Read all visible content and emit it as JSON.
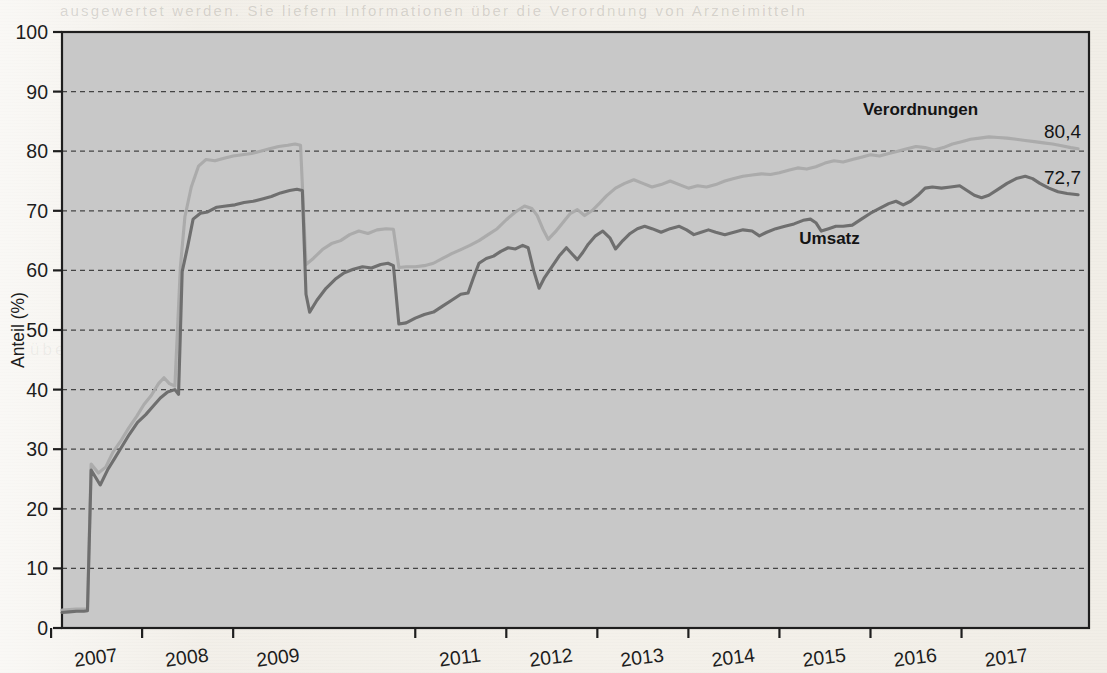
{
  "chart_data": {
    "type": "line",
    "title": "",
    "xlabel": "",
    "ylabel": "Anteil (%)",
    "ylim": [
      0,
      100
    ],
    "ytick_step": 10,
    "ytick_labels": [
      "0",
      "10",
      "20",
      "30",
      "40",
      "50",
      "60",
      "70",
      "80",
      "90",
      "100"
    ],
    "xtick_labels": [
      "2007",
      "2008",
      "2009",
      "2011",
      "2012",
      "2013",
      "2014",
      "2015",
      "2016",
      "2017"
    ],
    "grid": "horizontal-dashed",
    "legend_position": "inline-annotations",
    "plot_background": "#c8c8c8",
    "page_background": "#f3f0ea",
    "series": [
      {
        "name": "Verordnungen",
        "color": "#a9a9a9",
        "end_label": "80,4",
        "label_x": 2016.05,
        "label_y": 86.0,
        "points": [
          [
            2006.62,
            3.0
          ],
          [
            2006.7,
            3.1
          ],
          [
            2006.78,
            3.2
          ],
          [
            2006.86,
            3.2
          ],
          [
            2006.9,
            3.3
          ],
          [
            2006.94,
            27.5
          ],
          [
            2007.02,
            26.0
          ],
          [
            2007.1,
            27.0
          ],
          [
            2007.18,
            29.5
          ],
          [
            2007.27,
            31.5
          ],
          [
            2007.35,
            33.5
          ],
          [
            2007.44,
            35.5
          ],
          [
            2007.52,
            37.5
          ],
          [
            2007.6,
            39.0
          ],
          [
            2007.68,
            41.0
          ],
          [
            2007.74,
            42.0
          ],
          [
            2007.8,
            41.0
          ],
          [
            2007.86,
            40.6
          ],
          [
            2007.92,
            60.5
          ],
          [
            2007.97,
            69.0
          ],
          [
            2008.04,
            74.0
          ],
          [
            2008.12,
            77.5
          ],
          [
            2008.2,
            78.6
          ],
          [
            2008.3,
            78.4
          ],
          [
            2008.4,
            78.8
          ],
          [
            2008.5,
            79.2
          ],
          [
            2008.6,
            79.4
          ],
          [
            2008.7,
            79.6
          ],
          [
            2008.8,
            80.0
          ],
          [
            2008.9,
            80.4
          ],
          [
            2009.0,
            80.8
          ],
          [
            2009.1,
            81.0
          ],
          [
            2009.18,
            81.2
          ],
          [
            2009.24,
            81.0
          ],
          [
            2009.3,
            61.0
          ],
          [
            2009.38,
            62.0
          ],
          [
            2009.48,
            63.5
          ],
          [
            2009.58,
            64.5
          ],
          [
            2009.68,
            65.0
          ],
          [
            2009.78,
            66.0
          ],
          [
            2009.88,
            66.6
          ],
          [
            2009.98,
            66.2
          ],
          [
            2010.08,
            66.8
          ],
          [
            2010.18,
            67.0
          ],
          [
            2010.26,
            66.9
          ],
          [
            2010.32,
            60.5
          ],
          [
            2010.4,
            60.6
          ],
          [
            2010.5,
            60.6
          ],
          [
            2010.6,
            60.8
          ],
          [
            2010.7,
            61.2
          ],
          [
            2010.8,
            62.0
          ],
          [
            2010.9,
            62.8
          ],
          [
            2011.0,
            63.5
          ],
          [
            2011.1,
            64.2
          ],
          [
            2011.2,
            65.0
          ],
          [
            2011.3,
            66.0
          ],
          [
            2011.4,
            67.0
          ],
          [
            2011.5,
            68.5
          ],
          [
            2011.6,
            69.8
          ],
          [
            2011.7,
            70.8
          ],
          [
            2011.78,
            70.4
          ],
          [
            2011.84,
            69.2
          ],
          [
            2011.9,
            67.0
          ],
          [
            2011.96,
            65.2
          ],
          [
            2012.04,
            66.5
          ],
          [
            2012.12,
            68.0
          ],
          [
            2012.2,
            69.5
          ],
          [
            2012.28,
            70.2
          ],
          [
            2012.36,
            69.2
          ],
          [
            2012.44,
            70.0
          ],
          [
            2012.52,
            71.2
          ],
          [
            2012.6,
            72.5
          ],
          [
            2012.7,
            73.8
          ],
          [
            2012.8,
            74.6
          ],
          [
            2012.9,
            75.2
          ],
          [
            2013.0,
            74.6
          ],
          [
            2013.1,
            74.0
          ],
          [
            2013.2,
            74.4
          ],
          [
            2013.3,
            75.0
          ],
          [
            2013.4,
            74.4
          ],
          [
            2013.5,
            73.8
          ],
          [
            2013.6,
            74.2
          ],
          [
            2013.7,
            74.0
          ],
          [
            2013.8,
            74.4
          ],
          [
            2013.9,
            75.0
          ],
          [
            2014.0,
            75.4
          ],
          [
            2014.1,
            75.8
          ],
          [
            2014.2,
            76.0
          ],
          [
            2014.3,
            76.2
          ],
          [
            2014.4,
            76.1
          ],
          [
            2014.5,
            76.4
          ],
          [
            2014.6,
            76.8
          ],
          [
            2014.7,
            77.2
          ],
          [
            2014.8,
            77.0
          ],
          [
            2014.9,
            77.4
          ],
          [
            2015.0,
            78.0
          ],
          [
            2015.1,
            78.4
          ],
          [
            2015.2,
            78.2
          ],
          [
            2015.3,
            78.6
          ],
          [
            2015.4,
            79.0
          ],
          [
            2015.5,
            79.4
          ],
          [
            2015.6,
            79.2
          ],
          [
            2015.7,
            79.6
          ],
          [
            2015.8,
            80.0
          ],
          [
            2015.9,
            80.4
          ],
          [
            2016.0,
            80.8
          ],
          [
            2016.1,
            80.6
          ],
          [
            2016.2,
            80.2
          ],
          [
            2016.3,
            80.6
          ],
          [
            2016.4,
            81.2
          ],
          [
            2016.5,
            81.6
          ],
          [
            2016.6,
            82.0
          ],
          [
            2016.7,
            82.2
          ],
          [
            2016.8,
            82.4
          ],
          [
            2016.9,
            82.3
          ],
          [
            2017.0,
            82.2
          ],
          [
            2017.1,
            82.0
          ],
          [
            2017.2,
            81.8
          ],
          [
            2017.3,
            81.6
          ],
          [
            2017.4,
            81.4
          ],
          [
            2017.5,
            81.2
          ],
          [
            2017.6,
            80.9
          ],
          [
            2017.7,
            80.6
          ],
          [
            2017.78,
            80.4
          ]
        ]
      },
      {
        "name": "Umsatz",
        "color": "#6b6b6b",
        "end_label": "72,7",
        "label_x": 2015.05,
        "label_y": 64.5,
        "points": [
          [
            2006.62,
            2.6
          ],
          [
            2006.7,
            2.7
          ],
          [
            2006.78,
            2.8
          ],
          [
            2006.86,
            2.8
          ],
          [
            2006.9,
            2.9
          ],
          [
            2006.94,
            26.5
          ],
          [
            2007.0,
            25.0
          ],
          [
            2007.04,
            24.0
          ],
          [
            2007.12,
            26.5
          ],
          [
            2007.2,
            28.5
          ],
          [
            2007.28,
            30.5
          ],
          [
            2007.36,
            32.5
          ],
          [
            2007.45,
            34.5
          ],
          [
            2007.54,
            35.8
          ],
          [
            2007.62,
            37.2
          ],
          [
            2007.7,
            38.6
          ],
          [
            2007.78,
            39.6
          ],
          [
            2007.86,
            40.0
          ],
          [
            2007.9,
            39.2
          ],
          [
            2007.94,
            59.8
          ],
          [
            2008.0,
            64.0
          ],
          [
            2008.06,
            68.6
          ],
          [
            2008.14,
            69.6
          ],
          [
            2008.22,
            69.8
          ],
          [
            2008.32,
            70.6
          ],
          [
            2008.42,
            70.8
          ],
          [
            2008.52,
            71.0
          ],
          [
            2008.62,
            71.4
          ],
          [
            2008.72,
            71.6
          ],
          [
            2008.82,
            72.0
          ],
          [
            2008.92,
            72.4
          ],
          [
            2009.02,
            73.0
          ],
          [
            2009.12,
            73.4
          ],
          [
            2009.2,
            73.6
          ],
          [
            2009.26,
            73.4
          ],
          [
            2009.3,
            56.0
          ],
          [
            2009.34,
            53.0
          ],
          [
            2009.42,
            55.0
          ],
          [
            2009.52,
            57.0
          ],
          [
            2009.62,
            58.5
          ],
          [
            2009.72,
            59.6
          ],
          [
            2009.82,
            60.2
          ],
          [
            2009.92,
            60.6
          ],
          [
            2010.02,
            60.4
          ],
          [
            2010.12,
            61.0
          ],
          [
            2010.2,
            61.2
          ],
          [
            2010.26,
            60.8
          ],
          [
            2010.32,
            51.0
          ],
          [
            2010.4,
            51.2
          ],
          [
            2010.5,
            52.0
          ],
          [
            2010.6,
            52.6
          ],
          [
            2010.7,
            53.0
          ],
          [
            2010.8,
            54.0
          ],
          [
            2010.9,
            55.0
          ],
          [
            2011.0,
            56.0
          ],
          [
            2011.08,
            56.2
          ],
          [
            2011.14,
            58.8
          ],
          [
            2011.2,
            61.2
          ],
          [
            2011.28,
            62.0
          ],
          [
            2011.36,
            62.4
          ],
          [
            2011.44,
            63.2
          ],
          [
            2011.52,
            63.8
          ],
          [
            2011.6,
            63.6
          ],
          [
            2011.68,
            64.2
          ],
          [
            2011.74,
            63.8
          ],
          [
            2011.8,
            60.0
          ],
          [
            2011.86,
            57.0
          ],
          [
            2011.92,
            58.8
          ],
          [
            2012.0,
            60.6
          ],
          [
            2012.08,
            62.4
          ],
          [
            2012.16,
            63.8
          ],
          [
            2012.22,
            62.8
          ],
          [
            2012.28,
            61.8
          ],
          [
            2012.34,
            63.0
          ],
          [
            2012.4,
            64.4
          ],
          [
            2012.48,
            65.8
          ],
          [
            2012.56,
            66.6
          ],
          [
            2012.64,
            65.4
          ],
          [
            2012.7,
            63.6
          ],
          [
            2012.78,
            65.0
          ],
          [
            2012.86,
            66.2
          ],
          [
            2012.94,
            67.0
          ],
          [
            2013.02,
            67.4
          ],
          [
            2013.1,
            67.0
          ],
          [
            2013.2,
            66.4
          ],
          [
            2013.3,
            67.0
          ],
          [
            2013.4,
            67.4
          ],
          [
            2013.48,
            66.8
          ],
          [
            2013.56,
            66.0
          ],
          [
            2013.64,
            66.4
          ],
          [
            2013.72,
            66.8
          ],
          [
            2013.8,
            66.4
          ],
          [
            2013.9,
            66.0
          ],
          [
            2014.0,
            66.4
          ],
          [
            2014.1,
            66.8
          ],
          [
            2014.2,
            66.6
          ],
          [
            2014.28,
            65.8
          ],
          [
            2014.36,
            66.4
          ],
          [
            2014.46,
            67.0
          ],
          [
            2014.56,
            67.4
          ],
          [
            2014.66,
            67.8
          ],
          [
            2014.76,
            68.4
          ],
          [
            2014.84,
            68.6
          ],
          [
            2014.9,
            68.0
          ],
          [
            2014.96,
            66.6
          ],
          [
            2015.04,
            67.0
          ],
          [
            2015.12,
            67.4
          ],
          [
            2015.2,
            67.4
          ],
          [
            2015.3,
            67.6
          ],
          [
            2015.4,
            68.6
          ],
          [
            2015.5,
            69.6
          ],
          [
            2015.6,
            70.4
          ],
          [
            2015.7,
            71.2
          ],
          [
            2015.78,
            71.6
          ],
          [
            2015.86,
            71.0
          ],
          [
            2015.94,
            71.6
          ],
          [
            2016.02,
            72.6
          ],
          [
            2016.1,
            73.8
          ],
          [
            2016.18,
            74.0
          ],
          [
            2016.28,
            73.8
          ],
          [
            2016.38,
            74.0
          ],
          [
            2016.48,
            74.2
          ],
          [
            2016.56,
            73.4
          ],
          [
            2016.64,
            72.6
          ],
          [
            2016.72,
            72.2
          ],
          [
            2016.8,
            72.6
          ],
          [
            2016.9,
            73.6
          ],
          [
            2017.0,
            74.6
          ],
          [
            2017.1,
            75.4
          ],
          [
            2017.2,
            75.8
          ],
          [
            2017.28,
            75.4
          ],
          [
            2017.36,
            74.6
          ],
          [
            2017.46,
            73.8
          ],
          [
            2017.56,
            73.2
          ],
          [
            2017.66,
            72.9
          ],
          [
            2017.78,
            72.7
          ]
        ]
      }
    ]
  },
  "scan": {
    "bleed_top": "ausgewertet werden. Sie liefern Informationen über die Verordnung von Arzneimitteln",
    "bleed_body": "überwiegend von den gesetzlichen Krankenkassen getragen wurden"
  }
}
